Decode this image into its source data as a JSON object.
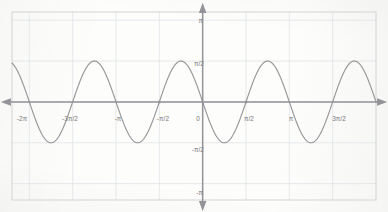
{
  "chart_data": {
    "type": "line",
    "title": "",
    "subtitle": "",
    "xlabel": "",
    "ylabel": "",
    "grid": true,
    "legend": null,
    "function": "y = -(pi/2) * sin(2x)",
    "amplitude_value": 1.5708,
    "amplitude_label": "π/2",
    "period_value": 3.1416,
    "period_label": "π",
    "xlim": [
      -6.9115,
      6.2832
    ],
    "ylim": [
      -3.7699,
      3.4558
    ],
    "xticks": [
      -6.2832,
      -4.7124,
      -3.1416,
      -1.5708,
      0,
      1.5708,
      3.1416,
      4.7124
    ],
    "xticklabels": [
      "-2π",
      "-3π/2",
      "-π",
      "-π/2",
      "0",
      "π/2",
      "π",
      "3π/2"
    ],
    "yticks": [
      3.1416,
      1.5708,
      -1.5708,
      -3.1416
    ],
    "yticklabels": [
      "π",
      "π/2",
      "-π/2",
      "-π"
    ],
    "origin_label": "0",
    "gridlines_x": [
      -6.2832,
      -4.7124,
      -3.1416,
      -1.5708,
      0,
      1.5708,
      3.1416,
      4.7124
    ],
    "gridlines_y": [
      3.1416,
      1.5708,
      0,
      -1.5708,
      -3.1416
    ],
    "zero_crossings": [
      -6.2832,
      -4.7124,
      -3.1416,
      -1.5708,
      0,
      1.5708,
      3.1416,
      4.7124,
      6.2832
    ],
    "maxima_x": [
      -5.4978,
      -2.3562,
      0.7854,
      3.927
    ],
    "maxima_y": 1.5708,
    "minima_x": [
      -3.927,
      -0.7854,
      2.3562,
      5.4978
    ],
    "minima_y": -1.5708,
    "marked_points": [
      {
        "x": -1.5708,
        "y": 0,
        "label": "-π/2"
      },
      {
        "x": 1.5708,
        "y": 0,
        "label": "π/2"
      }
    ],
    "series": [
      {
        "name": "y = -(π/2) sin(2x)",
        "color": "#8e8e90",
        "points_x": [
          -6.9115,
          -6.2832,
          -5.4978,
          -4.7124,
          -3.927,
          -3.1416,
          -2.3562,
          -1.5708,
          -0.7854,
          0,
          0.7854,
          1.5708,
          2.3562,
          3.1416,
          3.927,
          4.7124,
          5.4978,
          6.2832
        ],
        "points_y": [
          -0.9,
          0,
          1.5708,
          0,
          -1.5708,
          0,
          1.5708,
          0,
          -1.5708,
          0,
          -1.5708,
          0,
          -1.5708,
          0,
          1.5708,
          0,
          -1.5708,
          0
        ]
      }
    ],
    "axis_arrows": {
      "x_left": true,
      "x_right": true,
      "y_top": true,
      "y_bottom": true
    },
    "colors": {
      "curve": "#8e8e90",
      "axis": "#93939a",
      "grid": "#dfe3e6",
      "border": "#d3d4d6",
      "label_text": "#8d8d8f",
      "paper": "#fdfdfc"
    }
  }
}
